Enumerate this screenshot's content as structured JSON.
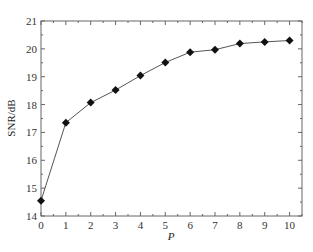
{
  "chart_data": {
    "type": "line",
    "title": "",
    "xlabel": "P",
    "ylabel": "SNR/dB",
    "xlim": [
      0,
      10.5
    ],
    "ylim": [
      14,
      21
    ],
    "x_ticks": [
      0,
      1,
      2,
      3,
      4,
      5,
      6,
      7,
      8,
      9,
      10
    ],
    "y_ticks": [
      14,
      15,
      16,
      17,
      18,
      19,
      20,
      21
    ],
    "grid": false,
    "legend": null,
    "marker": "diamond",
    "series": [
      {
        "name": "SNR",
        "x": [
          0,
          1,
          2,
          3,
          4,
          5,
          6,
          7,
          8,
          9,
          10
        ],
        "values": [
          14.55,
          17.35,
          18.07,
          18.52,
          19.04,
          19.51,
          19.88,
          19.97,
          20.19,
          20.25,
          20.3
        ]
      }
    ]
  },
  "colors": {
    "line": "#555555",
    "marker": "#111111",
    "axis": "#666666"
  }
}
